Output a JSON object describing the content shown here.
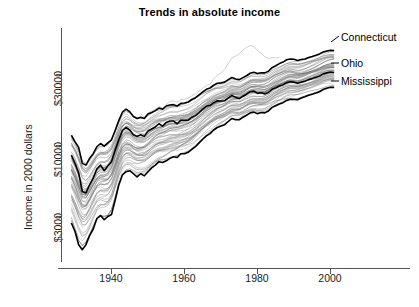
{
  "chart_data": {
    "type": "line",
    "title": "Trends in absolute income",
    "xlabel": "",
    "ylabel": "Income in 2000 dollars",
    "yscale": "log",
    "xlim": [
      1929,
      2002
    ],
    "ylim": [
      1700,
      48000
    ],
    "grid": false,
    "legend_position": "right-inline-labels",
    "xticks": [
      1940,
      1960,
      1980,
      2000
    ],
    "xtick_labels": [
      "1940",
      "1960",
      "1980",
      "2000"
    ],
    "yticks": [
      3000,
      10000,
      30000
    ],
    "ytick_labels": [
      "$3000",
      "$10000",
      "$30000"
    ],
    "annotations": [
      {
        "label": "Connecticut",
        "at_x": 2000,
        "at_y": 38000
      },
      {
        "label": "Ohio",
        "at_x": 2000,
        "at_y": 27000
      },
      {
        "label": "Mississippi",
        "at_x": 2000,
        "at_y": 21500
      }
    ],
    "series_count": 51,
    "series_description": "One line per US state, 1929-2001, per-capita income in constant 2000 dollars, log vertical scale. Three highlighted black lines: Connecticut (upper envelope), Ohio (middle), Mississippi (lower envelope). Remaining states drawn as thin gray lines. One light gray outlier rises far above the bundle in the mid-1970s.",
    "x": [
      1929,
      1930,
      1931,
      1932,
      1933,
      1934,
      1935,
      1936,
      1937,
      1938,
      1939,
      1940,
      1941,
      1942,
      1943,
      1944,
      1945,
      1946,
      1947,
      1948,
      1949,
      1950,
      1951,
      1952,
      1953,
      1954,
      1955,
      1956,
      1957,
      1958,
      1959,
      1960,
      1961,
      1962,
      1963,
      1964,
      1965,
      1966,
      1967,
      1968,
      1969,
      1970,
      1971,
      1972,
      1973,
      1974,
      1975,
      1976,
      1977,
      1978,
      1979,
      1980,
      1981,
      1982,
      1983,
      1984,
      1985,
      1986,
      1987,
      1988,
      1989,
      1990,
      1991,
      1992,
      1993,
      1994,
      1995,
      1996,
      1997,
      1998,
      1999,
      2000,
      2001
    ],
    "series": [
      {
        "name": "Connecticut",
        "role": "upper-envelope",
        "color": "#000000",
        "width": 1.6,
        "values": [
          11200,
          10100,
          9200,
          7100,
          6900,
          7700,
          8300,
          9300,
          9800,
          9400,
          9900,
          10400,
          12100,
          14200,
          16300,
          17100,
          16400,
          15200,
          14700,
          15000,
          14700,
          15800,
          16200,
          16700,
          17400,
          17100,
          18000,
          18300,
          18400,
          18000,
          18800,
          18900,
          19200,
          20000,
          20600,
          21600,
          22600,
          23600,
          24100,
          25200,
          26000,
          26200,
          26500,
          27600,
          28600,
          27900,
          27600,
          28500,
          29400,
          30600,
          31100,
          30500,
          30900,
          30800,
          31600,
          33500,
          34600,
          35800,
          36700,
          38100,
          38600,
          38400,
          37600,
          38300,
          38600,
          39500,
          40200,
          41000,
          41900,
          43200,
          43900,
          44500,
          44300
        ]
      },
      {
        "name": "Ohio",
        "role": "middle",
        "color": "#000000",
        "width": 1.6,
        "values": [
          8100,
          7100,
          6100,
          4500,
          4400,
          5000,
          5600,
          6500,
          6900,
          6300,
          6800,
          7300,
          8800,
          10400,
          12100,
          12700,
          12200,
          11300,
          11000,
          11300,
          11000,
          12000,
          12400,
          12800,
          13500,
          13000,
          13800,
          14100,
          14100,
          13500,
          14300,
          14300,
          14300,
          15000,
          15400,
          16200,
          17100,
          17900,
          18200,
          19000,
          19600,
          19500,
          19600,
          20500,
          21400,
          20700,
          20300,
          21100,
          21800,
          22700,
          22900,
          22100,
          22300,
          21900,
          22400,
          23600,
          24200,
          24900,
          25400,
          26300,
          26700,
          26500,
          26000,
          26500,
          26900,
          27600,
          28100,
          28700,
          29300,
          30300,
          30800,
          31200,
          31000
        ]
      },
      {
        "name": "Mississippi",
        "role": "lower-envelope",
        "color": "#000000",
        "width": 1.6,
        "values": [
          2700,
          2350,
          1900,
          1750,
          1900,
          2200,
          2450,
          2900,
          3050,
          2850,
          3000,
          3100,
          3900,
          5000,
          5900,
          6200,
          6300,
          6000,
          5700,
          6000,
          5800,
          6200,
          6600,
          6900,
          7300,
          7200,
          7400,
          7700,
          7900,
          7800,
          8300,
          8300,
          8500,
          8900,
          9300,
          9900,
          10500,
          11100,
          11500,
          12200,
          12700,
          13000,
          13300,
          14000,
          14700,
          14400,
          14400,
          15000,
          15500,
          16100,
          16300,
          15900,
          16200,
          16100,
          16600,
          17600,
          18100,
          18600,
          19000,
          19700,
          20100,
          20000,
          19900,
          20500,
          20900,
          21400,
          21800,
          22200,
          22700,
          23500,
          24000,
          24400,
          24300
        ]
      }
    ]
  },
  "labels": {
    "connecticut": "Connecticut",
    "ohio": "Ohio",
    "mississippi": "Mississippi"
  }
}
